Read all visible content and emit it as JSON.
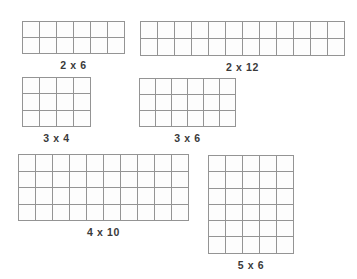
{
  "diagram": {
    "background_color": "#ffffff",
    "grid_line_color": "#949494",
    "label_color": "#3a3a3a",
    "arrays": [
      {
        "label": "2 x 6",
        "rows": 2,
        "cols": 6,
        "x": 22,
        "y": 21,
        "cell_w": 17,
        "cell_h": 16
      },
      {
        "label": "2 x 12",
        "rows": 2,
        "cols": 12,
        "x": 140,
        "y": 21,
        "cell_w": 17,
        "cell_h": 17
      },
      {
        "label": "3 x 4",
        "rows": 3,
        "cols": 4,
        "x": 22,
        "y": 77,
        "cell_w": 17,
        "cell_h": 16.3
      },
      {
        "label": "3 x 6",
        "rows": 3,
        "cols": 6,
        "x": 139,
        "y": 78,
        "cell_w": 16,
        "cell_h": 16
      },
      {
        "label": "4 x 10",
        "rows": 4,
        "cols": 10,
        "x": 18,
        "y": 154,
        "cell_w": 17,
        "cell_h": 16.5
      },
      {
        "label": "5 x 6",
        "rows": 6,
        "cols": 5,
        "x": 208,
        "y": 155,
        "cell_w": 17,
        "cell_h": 16.3
      }
    ]
  }
}
